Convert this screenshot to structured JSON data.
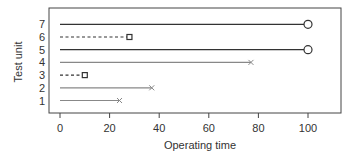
{
  "chart_data": {
    "type": "line",
    "title": "",
    "xlabel": "Operating time",
    "ylabel": "Test unit",
    "xlim": [
      -8,
      112
    ],
    "ylim": [
      0.5,
      7.5
    ],
    "xticks": [
      0,
      20,
      40,
      60,
      80,
      100
    ],
    "yticks": [
      1,
      2,
      3,
      4,
      5,
      6,
      7
    ],
    "grid": false,
    "legend": null,
    "series": [
      {
        "unit": 1,
        "start": 0,
        "end": 24,
        "marker": "x",
        "line": "solid",
        "color": "#888888",
        "event": "failure"
      },
      {
        "unit": 2,
        "start": 0,
        "end": 37,
        "marker": "x",
        "line": "solid",
        "color": "#888888",
        "event": "failure"
      },
      {
        "unit": 3,
        "start": 0,
        "end": 10,
        "marker": "square",
        "line": "dashed",
        "color": "#333333",
        "event": "removed"
      },
      {
        "unit": 4,
        "start": 0,
        "end": 77,
        "marker": "x",
        "line": "solid",
        "color": "#888888",
        "event": "failure"
      },
      {
        "unit": 5,
        "start": 0,
        "end": 100,
        "marker": "circle",
        "line": "solid",
        "color": "#333333",
        "event": "censored"
      },
      {
        "unit": 6,
        "start": 0,
        "end": 28,
        "marker": "square",
        "line": "dashed",
        "color": "#333333",
        "event": "removed"
      },
      {
        "unit": 7,
        "start": 0,
        "end": 100,
        "marker": "circle",
        "line": "solid",
        "color": "#333333",
        "event": "censored"
      }
    ]
  }
}
